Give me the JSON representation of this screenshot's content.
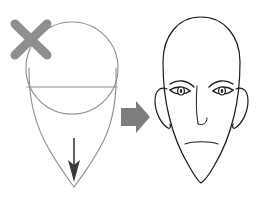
{
  "figure": {
    "background_color": "#ffffff",
    "width": 268,
    "height": 200
  },
  "panels": {
    "left": {
      "name": "construction-sketch",
      "label": "Head construction guide",
      "stroke_color": "#8c8c8c",
      "stroke_width": 1.1,
      "elements": [
        {
          "name": "cranium-circle",
          "label": "Cranium circle",
          "cx": 72,
          "cy": 68,
          "r": 46
        },
        {
          "name": "eyeline-guide",
          "label": "Horizontal eye line",
          "x1": 28,
          "y1": 87,
          "x2": 117,
          "y2": 87
        },
        {
          "name": "jaw-outline",
          "label": "V-shaped jaw outline"
        },
        {
          "name": "chin-direction-arrow",
          "label": "Chin direction arrow",
          "color": "#3a3a3a"
        },
        {
          "name": "reject-x-mark",
          "label": "X rejection mark",
          "color": "#8a8a8a",
          "stroke_width": 9
        }
      ]
    },
    "transition": {
      "name": "transform-arrow",
      "label": "Transforms into",
      "color": "#7d7d7d",
      "direction": "right"
    },
    "right": {
      "name": "finished-face",
      "label": "Finished face drawing",
      "stroke_color": "#1a1a1a",
      "stroke_width": 1.2,
      "features": [
        {
          "name": "head-outline",
          "label": "Head outline"
        },
        {
          "name": "left-ear",
          "label": "Left ear"
        },
        {
          "name": "right-ear",
          "label": "Right ear"
        },
        {
          "name": "left-eyebrow",
          "label": "Left eyebrow"
        },
        {
          "name": "right-eyebrow",
          "label": "Right eyebrow"
        },
        {
          "name": "left-eye",
          "label": "Left eye"
        },
        {
          "name": "right-eye",
          "label": "Right eye"
        },
        {
          "name": "nose",
          "label": "Nose"
        },
        {
          "name": "mouth",
          "label": "Mouth"
        }
      ]
    }
  },
  "captions": {
    "none": ""
  }
}
